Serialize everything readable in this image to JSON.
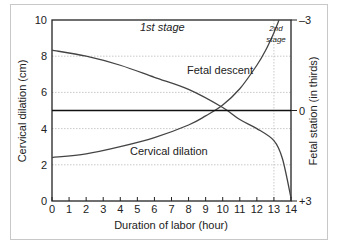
{
  "chart_data": {
    "type": "line",
    "title": "",
    "xlabel": "Duration of labor (hour)",
    "ylabel": "Cervical dilation (cm)",
    "ylabel_right": "Fetal station (in thirds)",
    "xlim": [
      0,
      14
    ],
    "ylim": [
      0,
      10
    ],
    "ylim_right": [
      -3,
      3
    ],
    "x_ticks": [
      "0",
      "1",
      "2",
      "3",
      "4",
      "5",
      "6",
      "7",
      "8",
      "9",
      "10",
      "11",
      "12",
      "13",
      "14"
    ],
    "y_ticks": [
      "0",
      "2",
      "4",
      "6",
      "8",
      "10"
    ],
    "y_ticks_right": [
      "-3",
      "0",
      "+3"
    ],
    "grid": "dotted horizontal at 2,4,6,8; dotted vertical at 13",
    "annotations": [
      "1st stage",
      "2nd stage"
    ],
    "series": [
      {
        "name": "Cervical dilation",
        "axis": "left",
        "x": [
          0,
          2,
          4,
          6,
          8,
          9,
          10,
          11,
          12,
          12.5,
          13,
          13.3
        ],
        "values": [
          2.4,
          2.6,
          3.0,
          3.5,
          4.2,
          4.7,
          5.3,
          6.2,
          7.5,
          8.3,
          9.3,
          10
        ]
      },
      {
        "name": "Fetal descent",
        "axis": "right",
        "x": [
          0,
          2,
          4,
          6,
          8,
          10,
          11,
          12,
          13,
          13.5,
          14
        ],
        "values": [
          -2.0,
          -1.8,
          -1.5,
          -1.1,
          -0.7,
          -0.1,
          0.3,
          0.6,
          1.0,
          1.6,
          2.9
        ]
      },
      {
        "name": "Station 0 reference",
        "axis": "right",
        "x": [
          0,
          14
        ],
        "values": [
          0,
          0
        ]
      }
    ]
  },
  "labels": {
    "stage1": "1st stage",
    "stage2_line1": "2nd",
    "stage2_line2": "stage",
    "fetal_descent": "Fetal descent",
    "cervical_dilation": "Cervical dilation",
    "xlabel": "Duration of labor (hour)",
    "ylabel": "Cervical dilation (cm)",
    "ylabel_right": "Fetal station (in thirds)"
  }
}
